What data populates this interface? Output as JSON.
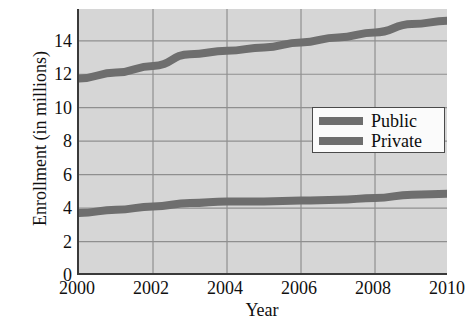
{
  "chart_data": {
    "type": "line",
    "title": "",
    "xlabel": "Year",
    "ylabel": "Enrollment (in millions)",
    "xlim": [
      2000,
      2010
    ],
    "ylim": [
      0,
      15.9
    ],
    "grid": true,
    "legend_position": "center-right",
    "x_ticks": [
      "2000",
      "2002",
      "2004",
      "2006",
      "2008",
      "2010"
    ],
    "x_tick_values": [
      2000,
      2002,
      2004,
      2006,
      2008,
      2010
    ],
    "y_ticks": [
      "0",
      "2",
      "4",
      "6",
      "8",
      "10",
      "12",
      "14"
    ],
    "y_tick_values": [
      0,
      2,
      4,
      6,
      8,
      10,
      12,
      14
    ],
    "x": [
      2000,
      2001,
      2002,
      2003,
      2004,
      2005,
      2006,
      2007,
      2008,
      2009,
      2010
    ],
    "series": [
      {
        "name": "Public",
        "color": "#6e6e6e",
        "values": [
          11.75,
          12.1,
          12.5,
          13.2,
          13.4,
          13.6,
          13.9,
          14.2,
          14.5,
          15.0,
          15.2
        ]
      },
      {
        "name": "Private",
        "color": "#6e6e6e",
        "values": [
          3.7,
          3.9,
          4.1,
          4.3,
          4.4,
          4.4,
          4.45,
          4.5,
          4.6,
          4.8,
          4.85
        ]
      }
    ]
  },
  "axes": {
    "y_title": "Enrollment (in millions)",
    "x_title": "Year",
    "y_tick_labels": [
      "14",
      "12",
      "10",
      "8",
      "6",
      "4",
      "2",
      "0"
    ],
    "x_tick_labels": [
      "2000",
      "2002",
      "2004",
      "2006",
      "2008",
      "2010"
    ]
  },
  "legend": {
    "items": [
      {
        "label": "Public",
        "color": "#6e6e6e"
      },
      {
        "label": "Private",
        "color": "#6e6e6e"
      }
    ]
  },
  "colors": {
    "plot_background": "#d6d6d6",
    "page_background": "#ffffff",
    "grid_line": "#8f8f8f",
    "axis_line": "#3a3a3a",
    "series_line": "#6e6e6e",
    "text": "#101010",
    "legend_background": "#fbfbfb",
    "legend_border": "#4a4a4a"
  }
}
